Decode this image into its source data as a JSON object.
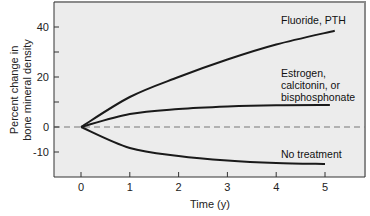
{
  "chart_data": {
    "type": "line",
    "title": "",
    "xlabel": "Time (y)",
    "ylabel": [
      "Percent change in",
      "bone mineral density"
    ],
    "xlim": [
      -0.55,
      5.8
    ],
    "ylim": [
      -20,
      50
    ],
    "x_ticks": [
      0,
      1,
      2,
      3,
      4,
      5
    ],
    "y_ticks": [
      -10,
      0,
      20,
      40
    ],
    "y_minor_ticks": [
      10,
      30
    ],
    "grid": false,
    "reference_line": {
      "y": 0,
      "style": "dashed"
    },
    "series": [
      {
        "name": "Fluoride, PTH",
        "label_lines": [
          "Fluoride, PTH"
        ],
        "x": [
          0,
          1,
          2,
          3,
          4,
          5.2
        ],
        "values": [
          0,
          12,
          20,
          27,
          33,
          38.5
        ]
      },
      {
        "name": "Estrogen, calcitonin, or bisphosphonate",
        "label_lines": [
          "Estrogen,",
          "calcitonin, or",
          "bisphosphonate"
        ],
        "x": [
          0,
          1,
          2,
          3,
          4,
          5.1
        ],
        "values": [
          0,
          5.2,
          7.2,
          8.2,
          8.7,
          8.8
        ]
      },
      {
        "name": "No treatment",
        "label_lines": [
          "No treatment"
        ],
        "x": [
          0,
          1,
          2,
          3,
          4,
          5
        ],
        "values": [
          0,
          -8.4,
          -11.6,
          -13.4,
          -14.4,
          -14.8
        ]
      }
    ]
  },
  "colors": {
    "plot_bg": "#ececec",
    "frame": "#8a8a8a",
    "line": "#1a1a1a",
    "dashed": "#777777"
  }
}
